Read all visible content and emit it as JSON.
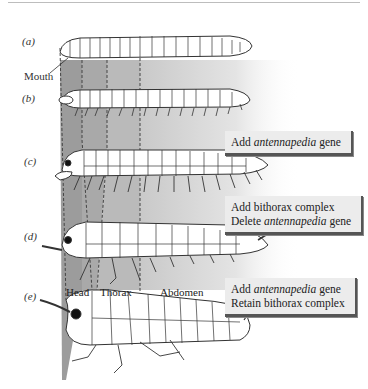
{
  "figure": {
    "panels": [
      {
        "id": "a",
        "label": "(a)"
      },
      {
        "id": "b",
        "label": "(b)"
      },
      {
        "id": "c",
        "label": "(c)"
      },
      {
        "id": "d",
        "label": "(d)"
      },
      {
        "id": "e",
        "label": "(e)"
      }
    ],
    "mouth_label": "Mouth",
    "regions": {
      "head": "Head",
      "thorax": "Thorax",
      "abdomen": "Abdomen"
    },
    "boxes": [
      {
        "id": "box-c",
        "line1_pre": "Add ",
        "line1_italic": "antennapedia",
        "line1_post": " gene",
        "line2_pre": "",
        "line2_italic": "",
        "line2_post": ""
      },
      {
        "id": "box-d",
        "line1_pre": "Add bithorax complex",
        "line1_italic": "",
        "line1_post": "",
        "line2_pre": "Delete ",
        "line2_italic": "antennapedia",
        "line2_post": " gene"
      },
      {
        "id": "box-e",
        "line1_pre": "Add ",
        "line1_italic": "antennapedia",
        "line1_post": " gene",
        "line2_pre": "Retain bithorax complex",
        "line2_italic": "",
        "line2_post": ""
      }
    ],
    "colors": {
      "head_band": "#9a9a9a",
      "thorax1_band": "#a8a8a8",
      "thorax2_band": "#b8b8b8",
      "abdomen_band": "#cfcfcf",
      "outline": "#333333",
      "box_bg": "#ececec",
      "box_shadow": "#555555"
    }
  }
}
